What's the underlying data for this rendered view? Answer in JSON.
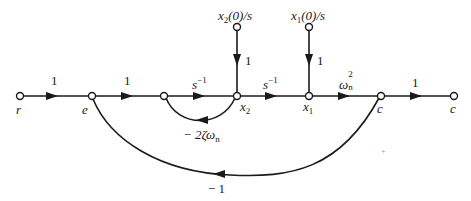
{
  "diagram": {
    "type": "signal-flow-graph",
    "line_color": "#1a1a1a",
    "background": "#ffffff",
    "nodes": [
      {
        "id": "r",
        "label": "r",
        "x": 20,
        "y": 96
      },
      {
        "id": "e",
        "label": "e",
        "x": 92,
        "y": 96
      },
      {
        "id": "n3",
        "label": "",
        "x": 164,
        "y": 96
      },
      {
        "id": "x2",
        "label": "x2",
        "x": 237,
        "y": 96
      },
      {
        "id": "x1",
        "label": "x1",
        "x": 309,
        "y": 96
      },
      {
        "id": "c",
        "label": "c",
        "x": 381,
        "y": 96
      },
      {
        "id": "c_out",
        "label": "c",
        "x": 454,
        "y": 96
      },
      {
        "id": "x2_init",
        "label": "x2(0)/s",
        "x": 237,
        "y": 27
      },
      {
        "id": "x1_init",
        "label": "x1(0)/s",
        "x": 309,
        "y": 27
      }
    ],
    "branches": [
      {
        "from": "r",
        "to": "e",
        "gain": "1"
      },
      {
        "from": "e",
        "to": "n3",
        "gain": "1"
      },
      {
        "from": "n3",
        "to": "x2",
        "gain": "s^-1"
      },
      {
        "from": "x2",
        "to": "x1",
        "gain": "s^-1"
      },
      {
        "from": "x1",
        "to": "c",
        "gain": "ωn^2"
      },
      {
        "from": "c",
        "to": "c_out",
        "gain": "1"
      },
      {
        "from": "x2_init",
        "to": "x2",
        "gain": "1"
      },
      {
        "from": "x1_init",
        "to": "x1",
        "gain": "1"
      },
      {
        "from": "x2",
        "to": "n3",
        "gain": "-2ζωn",
        "type": "feedback"
      },
      {
        "from": "c",
        "to": "e",
        "gain": "-1",
        "type": "feedback"
      }
    ]
  },
  "labels": {
    "node_r": "r",
    "node_e": "e",
    "node_x2": "x",
    "node_x2_sub": "2",
    "node_x1": "x",
    "node_x1_sub": "1",
    "node_c": "c",
    "node_c_out": "c",
    "x2_init_x": "x",
    "x2_init_sub": "2",
    "x2_init_rest": "(0)/s",
    "x1_init_x": "x",
    "x1_init_sub": "1",
    "x1_init_rest": "(0)/s",
    "gain_r_e": "1",
    "gain_e_n3": "1",
    "gain_n3_x2_base": "s",
    "gain_n3_x2_exp": "−1",
    "gain_x2_x1_base": "s",
    "gain_x2_x1_exp": "−1",
    "gain_x1_c_base": "ω",
    "gain_x1_c_sub": "n",
    "gain_x1_c_exp": "2",
    "gain_c_out": "1",
    "gain_x2_init": "1",
    "gain_x1_init": "1",
    "gain_inner_loop_prefix": "− 2ζω",
    "gain_inner_loop_sub": "n",
    "gain_outer_loop": "− 1",
    "stray_mark": "+"
  }
}
